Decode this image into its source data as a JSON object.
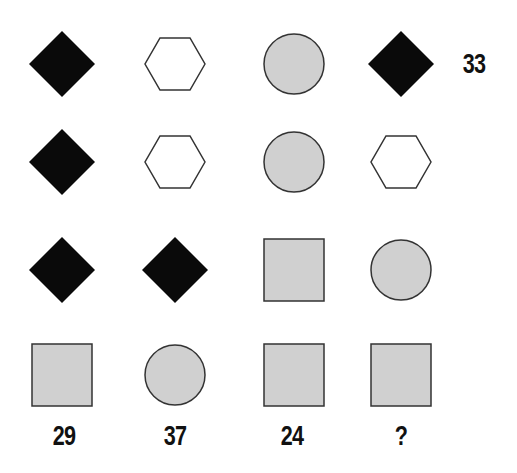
{
  "puzzle": {
    "colors": {
      "black": "#0a0a0a",
      "gray": "#d0d0d0",
      "white": "#ffffff",
      "outline": "#333333"
    },
    "grid": [
      [
        "diamond-black",
        "hexagon-white",
        "circle-gray",
        "diamond-black"
      ],
      [
        "diamond-black",
        "hexagon-white",
        "circle-gray",
        "hexagon-white"
      ],
      [
        "diamond-black",
        "diamond-black",
        "square-gray",
        "circle-gray"
      ],
      [
        "square-gray",
        "circle-gray",
        "square-gray",
        "square-gray"
      ]
    ],
    "row_totals": [
      "33",
      "",
      "",
      ""
    ],
    "column_totals": [
      "29",
      "37",
      "24",
      "?"
    ]
  }
}
